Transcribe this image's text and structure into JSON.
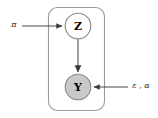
{
  "diagram": {
    "type": "plate-notation-graphical-model",
    "plate": {
      "label": ""
    },
    "nodes": [
      {
        "id": "Z",
        "label": "Z",
        "observed": false,
        "fill": "#ffffff",
        "stroke": "#808080",
        "cx": 78,
        "cy": 26,
        "r": 13
      },
      {
        "id": "Y",
        "label": "Y",
        "observed": true,
        "fill": "#c9c9c9",
        "stroke": "#808080",
        "cx": 78,
        "cy": 87,
        "r": 13
      }
    ],
    "parameters": [
      {
        "id": "pi",
        "label": "π",
        "target": "Z",
        "position": "left"
      },
      {
        "id": "eps-alpha",
        "label": "ε , α",
        "target": "Y",
        "position": "right"
      }
    ],
    "edges": [
      {
        "from": "pi",
        "to": "Z"
      },
      {
        "from": "Z",
        "to": "Y"
      },
      {
        "from": "eps-alpha",
        "to": "Y"
      }
    ],
    "colors": {
      "stroke": "#808080",
      "observed_fill": "#c9c9c9",
      "latent_fill": "#ffffff",
      "arrow": "#555555",
      "text": "#000000"
    }
  }
}
